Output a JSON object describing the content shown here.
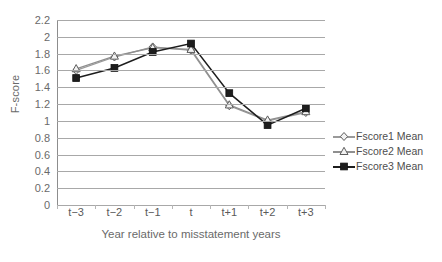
{
  "chart_data": {
    "type": "line",
    "title": "",
    "xlabel": "Year relative to misstatement years",
    "ylabel": "F-score",
    "categories": [
      "t−3",
      "t−2",
      "t−1",
      "t",
      "t+1",
      "t+2",
      "t+3"
    ],
    "ylim": [
      0,
      2.2
    ],
    "ytick_step": 0.2,
    "yticks": [
      "0",
      "0.2",
      "0.4",
      "0.6",
      "0.8",
      "1",
      "1.2",
      "1.4",
      "1.6",
      "1.8",
      "2",
      "2.2"
    ],
    "ytick_values": [
      0,
      0.2,
      0.4,
      0.6,
      0.8,
      1,
      1.2,
      1.4,
      1.6,
      1.8,
      2,
      2.2
    ],
    "grid": true,
    "grid_axis": "y",
    "legend_position": "right",
    "series": [
      {
        "name": "Fscore1 Mean",
        "marker": "diamond",
        "color": "#9a9a9a",
        "values": [
          1.6,
          1.76,
          1.88,
          1.84,
          1.18,
          1.0,
          1.1
        ]
      },
      {
        "name": "Fscore2 Mean",
        "marker": "triangle",
        "color": "#8f8f8f",
        "values": [
          1.62,
          1.77,
          1.87,
          1.85,
          1.19,
          1.01,
          1.11
        ]
      },
      {
        "name": "Fscore3 Mean",
        "marker": "square",
        "color": "#1d1d1d",
        "values": [
          1.51,
          1.63,
          1.82,
          1.92,
          1.33,
          0.95,
          1.15
        ]
      }
    ]
  },
  "legend": {
    "items": [
      {
        "label": "Fscore1 Mean",
        "marker": "diamond-marker-icon"
      },
      {
        "label": "Fscore2 Mean",
        "marker": "triangle-marker-icon"
      },
      {
        "label": "Fscore3 Mean",
        "marker": "square-marker-icon"
      }
    ]
  },
  "colors": {
    "grid": "#a8a8a8",
    "axis": "#8d8d8d",
    "series_light": "#9a9a9a",
    "series_dark": "#1d1d1d",
    "text": "#6a6a6a",
    "background": "#ffffff"
  }
}
